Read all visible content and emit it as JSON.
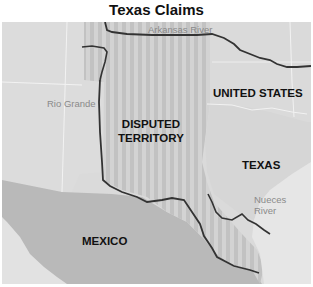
{
  "title": "Texas Claims",
  "labels": {
    "disputed_line1": "DISPUTED",
    "disputed_line2": "TERRITORY",
    "united_states": "UNITED STATES",
    "texas": "TEXAS",
    "mexico": "MEXICO"
  },
  "rivers": {
    "arkansas": "Arkansas River",
    "rio_grande": "Rio Grande",
    "nueces_line1": "Nueces",
    "nueces_line2": "River"
  },
  "colors": {
    "background": "#ffffff",
    "us_land": "#dcdcdc",
    "texas_land": "#d6d6d6",
    "mexico_land": "#b9b9b9",
    "gulf_water": "#e8e8e8",
    "disputed_stripe_a": "#c4c4c4",
    "disputed_stripe_b": "#d2d2d2",
    "river_line": "#333333",
    "border_white": "#f4f4f4"
  }
}
